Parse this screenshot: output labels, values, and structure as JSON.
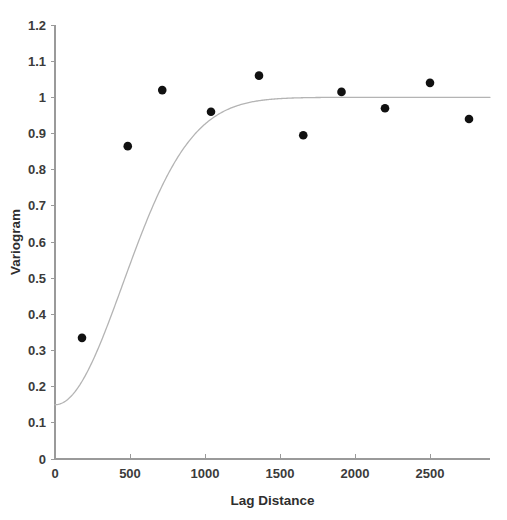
{
  "chart_data": {
    "type": "scatter",
    "title": "",
    "xlabel": "Lag Distance",
    "ylabel": "Variogram",
    "xlim": [
      0,
      2900
    ],
    "ylim": [
      0,
      1.2
    ],
    "grid": false,
    "legend": null,
    "x_ticks": [
      0,
      500,
      1000,
      1500,
      2000,
      2500
    ],
    "x_tick_labels": [
      "0",
      "500",
      "1000",
      "1500",
      "2000",
      "2500"
    ],
    "y_ticks": [
      0,
      0.1,
      0.2,
      0.3,
      0.4,
      0.5,
      0.6,
      0.7,
      0.8,
      0.9,
      1,
      1.1,
      1.2
    ],
    "y_tick_labels": [
      "0",
      "0.1",
      "0.2",
      "0.3",
      "0.4",
      "0.5",
      "0.6",
      "0.7",
      "0.8",
      "0.9",
      "1",
      "1.1",
      "1.2"
    ],
    "series": [
      {
        "name": "Experimental variogram",
        "type": "scatter",
        "marker": "filled-circle",
        "color": "#111111",
        "x": [
          180,
          485,
          715,
          1040,
          1360,
          1655,
          1910,
          2200,
          2500,
          2760
        ],
        "y": [
          0.335,
          0.865,
          1.02,
          0.96,
          1.06,
          0.895,
          1.015,
          0.97,
          1.04,
          0.94
        ]
      },
      {
        "name": "Fitted model",
        "type": "line",
        "color": "#b4b4b4",
        "model": "gaussian",
        "nugget": 0.15,
        "sill": 1.0,
        "range": 640,
        "x_start": 0,
        "x_end": 2900
      }
    ]
  },
  "axes": {
    "y_axis_title": "Variogram",
    "x_axis_title": "Lag Distance"
  },
  "colors": {
    "background": "#ffffff",
    "axis": "#9a9a9a",
    "point": "#111111",
    "curve": "#b4b4b4",
    "text": "#2e2e2e"
  }
}
